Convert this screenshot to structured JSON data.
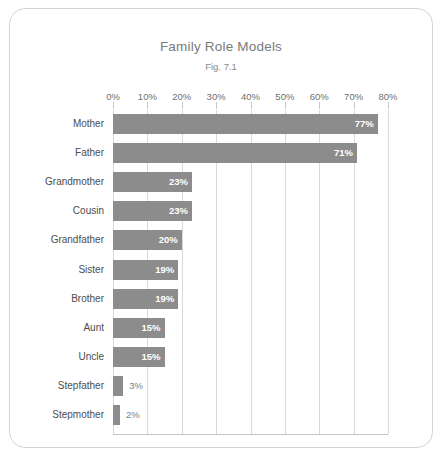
{
  "chart_data": {
    "type": "bar",
    "orientation": "horizontal",
    "title": "Family Role Models",
    "subtitle": "Fig. 7.1",
    "xlabel": "",
    "ylabel": "",
    "xlim": [
      0,
      80
    ],
    "grid": "vertical",
    "legend": "none",
    "categories": [
      "Mother",
      "Father",
      "Grandmother",
      "Cousin",
      "Grandfather",
      "Sister",
      "Brother",
      "Aunt",
      "Uncle",
      "Stepfather",
      "Stepmother"
    ],
    "values": [
      77,
      71,
      23,
      23,
      20,
      19,
      19,
      15,
      15,
      3,
      2
    ],
    "value_labels": [
      "77%",
      "71%",
      "23%",
      "23%",
      "20%",
      "19%",
      "19%",
      "15%",
      "15%",
      "3%",
      "2%"
    ],
    "label_placement": [
      "inside",
      "inside",
      "inside",
      "inside",
      "inside",
      "inside",
      "inside",
      "inside",
      "inside",
      "outside",
      "outside"
    ],
    "xticks": [
      0,
      10,
      20,
      30,
      40,
      50,
      60,
      70,
      80
    ],
    "xtick_labels": [
      "0%",
      "10%",
      "20%",
      "30%",
      "40%",
      "50%",
      "60%",
      "70%",
      "80%"
    ],
    "colors": {
      "bar": "#8c8c8c",
      "gridline": "#d9d9d9",
      "baseline": "#c4c4c4",
      "frame": "#d4d4d4",
      "background": "#ffffff",
      "title_text": "#7a7a7a",
      "category_text": "#4d4d4d",
      "value_text_inside": "#ffffff",
      "value_text_outside": "#7d7d7d"
    }
  }
}
